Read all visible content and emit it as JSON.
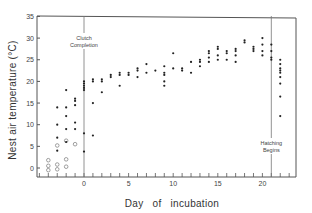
{
  "chart_data": {
    "type": "scatter",
    "title": "",
    "xlabel": "Day of incubation",
    "ylabel": "Nest air temperature (°C)",
    "xlim": [
      -5.3,
      23.8
    ],
    "ylim": [
      -1.5,
      35
    ],
    "x_ticks": [
      0,
      5,
      10,
      15,
      20
    ],
    "y_ticks": [
      0,
      5,
      10,
      15,
      20,
      25,
      30,
      35
    ],
    "x_minor_step": 1,
    "grid": false,
    "legend": null,
    "annotations": [
      {
        "text_lines": [
          "Clutch",
          "Completion"
        ],
        "x": 0,
        "kind": "vertical-line"
      },
      {
        "text_lines": [
          "Hatching",
          "Begins"
        ],
        "x": 21,
        "kind": "vertical-line"
      }
    ],
    "series": [
      {
        "name": "Empty nest (open circles)",
        "marker": "open-circle",
        "points": [
          [
            -4,
            -0.5
          ],
          [
            -4,
            0.5
          ],
          [
            -4,
            1.8
          ],
          [
            -3,
            0.8
          ],
          [
            -3,
            5.2
          ],
          [
            -3,
            -0.3
          ],
          [
            -2,
            2.0
          ],
          [
            -2,
            6.3
          ],
          [
            -2,
            0.3
          ],
          [
            -1,
            5.5
          ]
        ]
      },
      {
        "name": "Nest with eggs (filled dots)",
        "marker": "filled-dot",
        "points": [
          [
            -3,
            14
          ],
          [
            -3,
            10
          ],
          [
            -3,
            7
          ],
          [
            -3,
            4
          ],
          [
            -2,
            18
          ],
          [
            -2,
            14
          ],
          [
            -2,
            12
          ],
          [
            -2,
            9
          ],
          [
            -2,
            6
          ],
          [
            -1,
            16
          ],
          [
            -1,
            15.5
          ],
          [
            -1,
            14.5
          ],
          [
            -1,
            10.5
          ],
          [
            -1,
            9
          ],
          [
            0,
            20
          ],
          [
            0,
            19.5
          ],
          [
            0,
            19
          ],
          [
            0,
            18.5
          ],
          [
            0,
            18
          ],
          [
            0,
            8
          ],
          [
            0,
            3.8
          ],
          [
            1,
            20.5
          ],
          [
            1,
            20
          ],
          [
            1,
            15
          ],
          [
            1,
            7.5
          ],
          [
            2,
            20.5
          ],
          [
            2,
            20
          ],
          [
            2,
            17.5
          ],
          [
            3,
            21.5
          ],
          [
            3,
            21
          ],
          [
            4,
            22
          ],
          [
            4,
            21.5
          ],
          [
            4,
            19
          ],
          [
            5,
            22
          ],
          [
            5,
            21.5
          ],
          [
            6,
            23
          ],
          [
            6,
            22.5
          ],
          [
            6,
            21
          ],
          [
            7,
            22
          ],
          [
            7,
            24
          ],
          [
            8,
            22.5
          ],
          [
            9,
            23.5
          ],
          [
            9,
            22
          ],
          [
            9,
            21.5
          ],
          [
            9,
            20
          ],
          [
            9,
            19
          ],
          [
            10,
            26.5
          ],
          [
            10,
            23
          ],
          [
            11,
            23
          ],
          [
            11,
            22.5
          ],
          [
            12,
            24.5
          ],
          [
            12,
            22
          ],
          [
            13,
            25
          ],
          [
            13,
            24.5
          ],
          [
            13,
            23.5
          ],
          [
            14,
            27
          ],
          [
            14,
            26.5
          ],
          [
            14,
            25.5
          ],
          [
            14,
            24.5
          ],
          [
            15,
            28
          ],
          [
            15,
            27.5
          ],
          [
            15,
            26
          ],
          [
            15,
            25
          ],
          [
            16,
            27
          ],
          [
            16,
            26.5
          ],
          [
            16,
            25
          ],
          [
            17,
            27.5
          ],
          [
            17,
            27
          ],
          [
            17,
            26
          ],
          [
            17,
            24.5
          ],
          [
            18,
            29.5
          ],
          [
            18,
            29
          ],
          [
            19,
            28
          ],
          [
            19,
            27.5
          ],
          [
            19,
            27
          ],
          [
            20,
            30
          ],
          [
            20,
            28.5
          ],
          [
            20,
            27
          ],
          [
            20,
            26
          ],
          [
            21,
            28.5
          ],
          [
            21,
            27
          ],
          [
            21,
            25.5
          ],
          [
            21,
            25
          ],
          [
            22,
            25
          ],
          [
            22,
            24
          ],
          [
            22,
            23
          ],
          [
            22,
            22.5
          ],
          [
            22,
            22
          ],
          [
            22,
            21
          ],
          [
            22,
            19.5
          ],
          [
            22,
            16.5
          ],
          [
            22,
            12
          ]
        ]
      }
    ]
  }
}
